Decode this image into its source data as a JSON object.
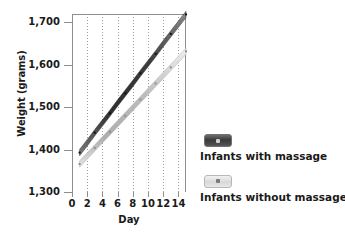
{
  "chart_data": {
    "type": "line",
    "title": "",
    "xlabel": "Day",
    "ylabel": "Weight (grams)",
    "xlim": [
      0,
      15
    ],
    "ylim": [
      1300,
      1720
    ],
    "xticks": [
      0,
      2,
      4,
      6,
      8,
      10,
      12,
      14
    ],
    "xtick_labels": [
      "0",
      "2",
      "4",
      "6",
      "8",
      "10",
      "12",
      "14"
    ],
    "yticks": [
      1300,
      1400,
      1500,
      1600,
      1700
    ],
    "ytick_labels": [
      "1,300",
      "1,400",
      "1,500",
      "1,600",
      "1,700"
    ],
    "grid": "vertical-dotted",
    "legend_position": "right",
    "series": [
      {
        "name": "Infants with massage",
        "color": "#4a4a4a",
        "x": [
          1,
          2,
          3,
          4,
          5,
          6,
          7,
          8,
          9,
          10,
          11,
          12,
          13,
          14,
          15
        ],
        "values": [
          1393,
          1416,
          1440,
          1463,
          1486,
          1510,
          1533,
          1556,
          1580,
          1603,
          1626,
          1650,
          1673,
          1696,
          1719
        ]
      },
      {
        "name": "Infants without massage",
        "color": "#c2c2c2",
        "x": [
          1,
          2,
          3,
          4,
          5,
          6,
          7,
          8,
          9,
          10,
          11,
          12,
          13,
          14,
          15
        ],
        "values": [
          1366,
          1385,
          1404,
          1423,
          1442,
          1461,
          1480,
          1499,
          1518,
          1537,
          1556,
          1575,
          1594,
          1613,
          1632
        ]
      }
    ]
  },
  "legend": {
    "entries": [
      {
        "label": "Infants with massage",
        "swatch": "dark-swatch-icon"
      },
      {
        "label": "Infants without massage",
        "swatch": "light-swatch-icon"
      }
    ]
  },
  "axes": {
    "y_title": "Weight (grams)",
    "x_title": "Day"
  }
}
